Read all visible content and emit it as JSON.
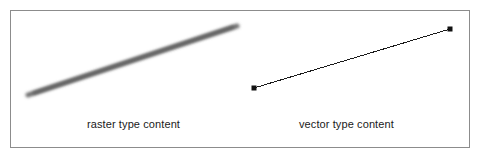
{
  "figure": {
    "background_color": "#ffffff",
    "frame": {
      "border_color": "#8c8c8c",
      "border_width_px": 1,
      "x": 10,
      "y": 10,
      "width": 460,
      "height": 138
    }
  },
  "panels": {
    "raster": {
      "caption": "raster type content",
      "line": {
        "style": "blurred anti-aliased pixelated stroke",
        "color": "#6e6e6e",
        "stroke_width_px": 5,
        "blur_px": 1.6,
        "x1": 28,
        "y1": 95,
        "x2": 237,
        "y2": 26
      }
    },
    "vector": {
      "caption": "vector type content",
      "line": {
        "style": "crisp hairline stroke with square endpoint nodes",
        "color": "#1a1a1a",
        "stroke_width_px": 1,
        "x1": 254,
        "y1": 88,
        "x2": 450,
        "y2": 29
      },
      "nodes": [
        {
          "name": "start-node",
          "x": 254,
          "y": 88,
          "size_px": 5,
          "color": "#111111"
        },
        {
          "name": "end-node",
          "x": 450,
          "y": 29,
          "size_px": 5,
          "color": "#111111"
        }
      ]
    }
  }
}
